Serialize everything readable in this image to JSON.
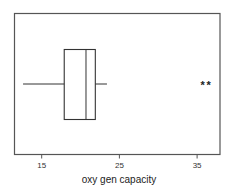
{
  "chart_data": {
    "type": "boxplot",
    "title": "",
    "xlabel": "oxy gen capacity",
    "ylabel": "",
    "xlim": [
      11.5,
      37.5
    ],
    "ticks": [
      15,
      25,
      35
    ],
    "tick_labels": [
      "15",
      "25",
      "35"
    ],
    "grid": false,
    "orientation": "horizontal",
    "box": {
      "whisker_low": 12.6,
      "q1": 17.9,
      "median": 20.7,
      "q3": 21.9,
      "whisker_high": 23.4
    },
    "outliers": [
      35.7,
      36.5
    ],
    "outlier_marker": "*"
  },
  "colors": {
    "frame": "#555555",
    "box": "#333333",
    "outlier": "#222222"
  }
}
